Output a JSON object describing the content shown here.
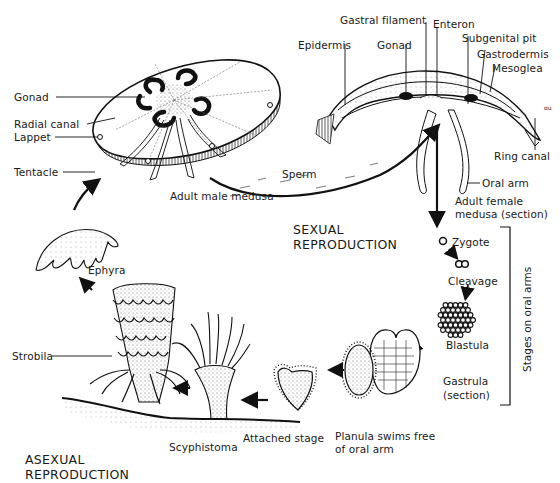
{
  "diagram": {
    "sections": {
      "sexual": [
        "SEXUAL",
        "REPRODUCTION"
      ],
      "asexual": [
        "ASEXUAL",
        "REPRODUCTION"
      ]
    },
    "male_medusa": {
      "caption": "Adult male medusa",
      "labels": {
        "gonad": "Gonad",
        "radial_canal": "Radial canal",
        "lappet": "Lappet",
        "tentacle": "Tentacle"
      }
    },
    "female_medusa": {
      "caption": [
        "Adult female",
        "medusa (section)"
      ],
      "labels": {
        "gastral_filament": "Gastral filament",
        "enteron": "Enteron",
        "epidermis": "Epidermis",
        "gonad": "Gonad",
        "subgenital_pit": "Subgenital pit",
        "gastrodermis": "Gastrodermis",
        "mesoglea": "Mesoglea",
        "ring_canal": "Ring canal",
        "oral_arm": "Oral arm",
        "scale_mark": "ou"
      }
    },
    "sperm_label": "Sperm",
    "stages": {
      "zygote": "Zygote",
      "cleavage": "Cleavage",
      "blastula": "Blastula",
      "gastrula": [
        "Gastrula",
        "(section)"
      ],
      "planula": [
        "Planula swims free",
        "of oral arm"
      ],
      "attached": "Attached stage",
      "scyphistoma": "Scyphistoma",
      "strobila": "Strobila",
      "ephyra": "Ephyra"
    },
    "bracket_label": "Stages on oral arms"
  }
}
